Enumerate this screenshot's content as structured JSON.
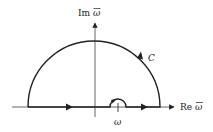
{
  "diagram": {
    "axes": {
      "imag_label_prefix": "Im",
      "imag_label_var": "ω",
      "real_label_prefix": "Re",
      "real_label_var": "ω"
    },
    "contour_label": "C",
    "pole_label": "ω",
    "colors": {
      "stroke": "#222222",
      "axis": "#555555",
      "background": "#ffffff"
    }
  }
}
